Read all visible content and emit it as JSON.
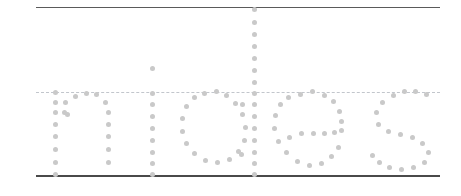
{
  "canvas": {
    "width": 461,
    "height": 196,
    "background": "#ffffff"
  },
  "guides": {
    "description": "Handwriting practice guide rules",
    "line_left": 36,
    "line_right": 440,
    "ascender_line": {
      "label": "ascender-line",
      "y": 7,
      "style": "solid",
      "color": "#5a5a5a",
      "thickness": 1.6
    },
    "xheight_line": {
      "label": "x-height-line",
      "y": 92,
      "style": "dashed",
      "color": "#c2c6cc",
      "thickness": 1.4,
      "dash": "7px 6px"
    },
    "baseline": {
      "label": "baseline",
      "y": 175,
      "style": "solid",
      "color": "#4a4a4a",
      "thickness": 2.2
    }
  },
  "word": {
    "text": "nibes",
    "rendering": "dotted-stipple",
    "dot_color": "#c9c9c9",
    "dot_diameter": 5
  },
  "glyphs": [
    {
      "char": "n",
      "name": "letter-n",
      "dots": [
        [
          55,
          92
        ],
        [
          55,
          102
        ],
        [
          55,
          112
        ],
        [
          55,
          124
        ],
        [
          55,
          136
        ],
        [
          55,
          149
        ],
        [
          55,
          162
        ],
        [
          55,
          174
        ],
        [
          64,
          112
        ],
        [
          67,
          114
        ],
        [
          65,
          102
        ],
        [
          75,
          96
        ],
        [
          86,
          93
        ],
        [
          96,
          94
        ],
        [
          105,
          102
        ],
        [
          108,
          112
        ],
        [
          108,
          124
        ],
        [
          108,
          136
        ],
        [
          108,
          149
        ],
        [
          108,
          162
        ]
      ]
    },
    {
      "char": "i",
      "name": "letter-i",
      "dots": [
        [
          152,
          68
        ],
        [
          152,
          93
        ],
        [
          152,
          104
        ],
        [
          152,
          116
        ],
        [
          152,
          128
        ],
        [
          152,
          140
        ],
        [
          152,
          152
        ],
        [
          152,
          163
        ],
        [
          152,
          174
        ]
      ]
    },
    {
      "char": "o",
      "name": "letter-o",
      "dots": [
        [
          204,
          93
        ],
        [
          216,
          91
        ],
        [
          194,
          97
        ],
        [
          186,
          106
        ],
        [
          182,
          118
        ],
        [
          182,
          131
        ],
        [
          186,
          143
        ],
        [
          194,
          153
        ],
        [
          205,
          160
        ],
        [
          217,
          162
        ],
        [
          229,
          159
        ],
        [
          238,
          151
        ],
        [
          244,
          140
        ],
        [
          245,
          127
        ],
        [
          242,
          114
        ],
        [
          235,
          103
        ],
        [
          226,
          95
        ]
      ]
    },
    {
      "char": "b",
      "name": "letter-b",
      "dots": [
        [
          254,
          9
        ],
        [
          254,
          22
        ],
        [
          254,
          34
        ],
        [
          254,
          46
        ],
        [
          254,
          58
        ],
        [
          254,
          70
        ],
        [
          254,
          82
        ],
        [
          254,
          93
        ],
        [
          254,
          104
        ],
        [
          254,
          116
        ],
        [
          254,
          128
        ],
        [
          254,
          140
        ],
        [
          254,
          152
        ],
        [
          254,
          163
        ],
        [
          254,
          174
        ],
        [
          242,
          104
        ],
        [
          241,
          154
        ]
      ]
    },
    {
      "char": "e",
      "name": "letter-e",
      "dots": [
        [
          300,
          94
        ],
        [
          312,
          91
        ],
        [
          288,
          97
        ],
        [
          280,
          104
        ],
        [
          289,
          137
        ],
        [
          275,
          115
        ],
        [
          274,
          128
        ],
        [
          278,
          141
        ],
        [
          286,
          152
        ],
        [
          297,
          161
        ],
        [
          309,
          165
        ],
        [
          321,
          163
        ],
        [
          331,
          156
        ],
        [
          338,
          147
        ],
        [
          301,
          133
        ],
        [
          313,
          133
        ],
        [
          324,
          133
        ],
        [
          334,
          132
        ],
        [
          341,
          130
        ],
        [
          324,
          95
        ],
        [
          333,
          101
        ],
        [
          339,
          111
        ],
        [
          341,
          121
        ]
      ]
    },
    {
      "char": "s",
      "name": "letter-s",
      "dots": [
        [
          393,
          95
        ],
        [
          404,
          91
        ],
        [
          415,
          91
        ],
        [
          426,
          94
        ],
        [
          382,
          102
        ],
        [
          376,
          112
        ],
        [
          378,
          124
        ],
        [
          388,
          131
        ],
        [
          400,
          134
        ],
        [
          412,
          137
        ],
        [
          422,
          143
        ],
        [
          428,
          152
        ],
        [
          424,
          162
        ],
        [
          413,
          167
        ],
        [
          401,
          169
        ],
        [
          389,
          167
        ],
        [
          379,
          162
        ],
        [
          372,
          155
        ]
      ]
    }
  ]
}
